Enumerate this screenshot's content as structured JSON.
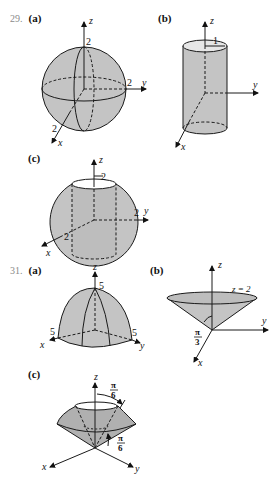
{
  "colors": {
    "fill": "#c4c4c4",
    "stroke": "#1a1a1a",
    "number": "#8a8a8a"
  },
  "problem29": {
    "number": "29.",
    "a": {
      "part": "(a)",
      "shape": "sphere",
      "z": "z",
      "y": "y",
      "x": "x",
      "r_z": "2",
      "r_y": "2",
      "r_x": "2"
    },
    "b": {
      "part": "(b)",
      "shape": "cylinder",
      "z": "z",
      "y": "y",
      "x": "x",
      "radius": "1"
    },
    "c": {
      "part": "(c)",
      "shape": "sphere-with-cylindrical-hole",
      "z": "z",
      "y": "y",
      "x": "x",
      "hole_r": "2",
      "r_y": "2",
      "r_x": "2"
    }
  },
  "problem31": {
    "number": "31.",
    "a": {
      "part": "(a)",
      "shape": "hemisphere-like dome",
      "z": "z",
      "y": "y",
      "x": "x",
      "r_z": "5",
      "r_x": "5",
      "r_y": "5"
    },
    "b": {
      "part": "(b)",
      "shape": "cone",
      "z": "z",
      "y": "y",
      "x": "x",
      "plane": "z = 2",
      "angle_num": "π",
      "angle_den": "3"
    },
    "c": {
      "part": "(c)",
      "shape": "region between cones",
      "z": "z",
      "y": "y",
      "x": "x",
      "angle1_num": "π",
      "angle1_den": "6",
      "angle2_num": "π",
      "angle2_den": "6"
    }
  }
}
